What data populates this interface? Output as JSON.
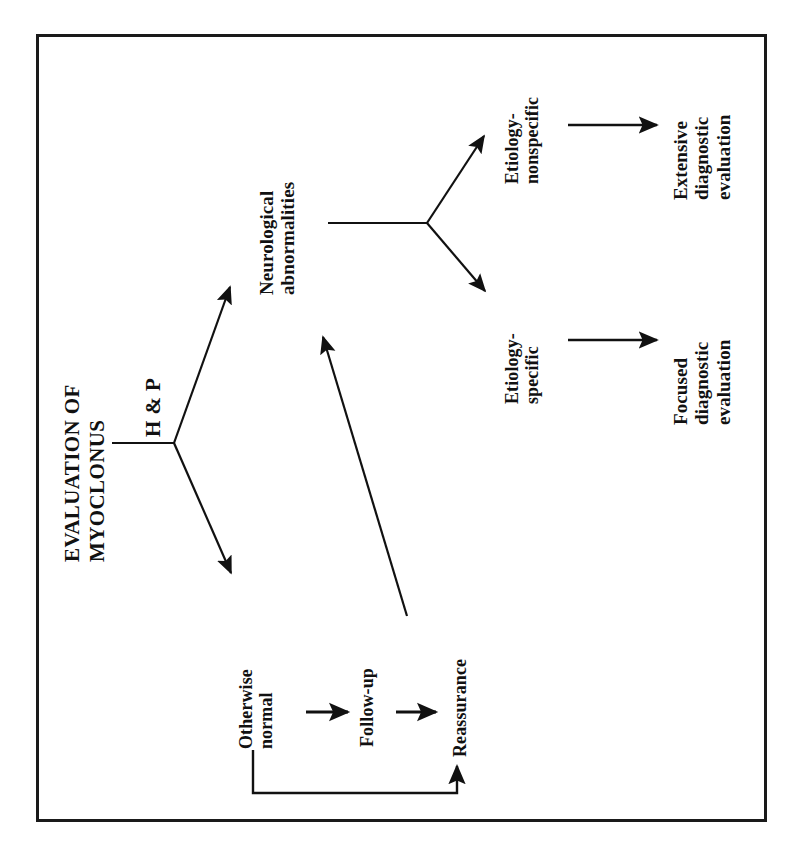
{
  "figure": {
    "title_lines": [
      "EVALUATION OF",
      "MYOCLONUS"
    ],
    "title_full": "EVALUATION OF MYOCLONUS",
    "orientation": "rotated-90-ccw",
    "border_color": "#1a1a1a",
    "ink_color": "#111111",
    "background_color": "#ffffff"
  },
  "nodes": {
    "hp": {
      "label": "H & P",
      "lines": [
        "H & P"
      ]
    },
    "neuro": {
      "label": "Neurological abnormalities",
      "lines": [
        "Neurological",
        "abnormalities"
      ]
    },
    "etiology_nonspecific": {
      "label": "Etiology-nonspecific",
      "lines": [
        "Etiology-",
        "nonspecific"
      ]
    },
    "etiology_specific": {
      "label": "Etiology-specific",
      "lines": [
        "Etiology-",
        "specific"
      ]
    },
    "extensive": {
      "label": "Extensive diagnostic evaluation",
      "lines": [
        "Extensive",
        "diagnostic",
        "evaluation"
      ]
    },
    "focused": {
      "label": "Focused diagnostic evaluation",
      "lines": [
        "Focused",
        "diagnostic",
        "evaluation"
      ]
    },
    "otherwise_normal": {
      "label": "Otherwise normal",
      "lines": [
        "Otherwise",
        "normal"
      ]
    },
    "followup": {
      "label": "Follow-up",
      "lines": [
        "Follow-up"
      ]
    },
    "reassurance": {
      "label": "Reassurance",
      "lines": [
        "Reassurance"
      ]
    }
  },
  "edges": [
    {
      "from": "hp",
      "to": "neuro",
      "style": "arrow"
    },
    {
      "from": "hp",
      "to": "otherwise_normal",
      "style": "arrow"
    },
    {
      "from": "neuro",
      "to": "etiology_nonspecific",
      "style": "arrow"
    },
    {
      "from": "neuro",
      "to": "etiology_specific",
      "style": "arrow"
    },
    {
      "from": "etiology_nonspecific",
      "to": "extensive",
      "style": "arrow"
    },
    {
      "from": "etiology_specific",
      "to": "focused",
      "style": "arrow"
    },
    {
      "from": "otherwise_normal",
      "to": "followup",
      "style": "arrow"
    },
    {
      "from": "followup",
      "to": "reassurance",
      "style": "arrow"
    },
    {
      "from": "reassurance",
      "to": "neuro",
      "style": "arrow"
    },
    {
      "from": "otherwise_normal",
      "to": "reassurance",
      "style": "feedback-loop"
    }
  ]
}
